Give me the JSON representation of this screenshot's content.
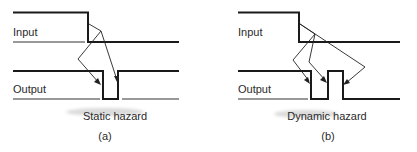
{
  "panel_a": {
    "input_label": "Input",
    "output_label": "Output",
    "title": "Static hazard",
    "tag": "(a)"
  },
  "panel_b": {
    "input_label": "Input",
    "output_label": "Output",
    "title": "Dynamic hazard",
    "tag": "(b)"
  },
  "colors": {
    "line": "#1a1a1a",
    "text": "#2a2a2a"
  }
}
